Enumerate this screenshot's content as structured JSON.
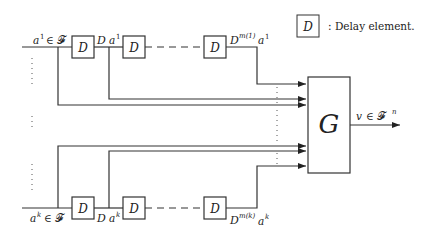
{
  "legend": {
    "box_label": "D",
    "text": ": Delay element."
  },
  "top_chain": {
    "input_label_var": "a",
    "input_label_sup": "1",
    "input_label_rest": "∈ 𝓕",
    "delay1_label": "D",
    "between_label_D": "D",
    "between_label_var": "a",
    "between_label_sup": "1",
    "delay2_label": "D",
    "delay3_label": "D",
    "output_label_D": "D",
    "output_label_sup": "m(1)",
    "output_label_var": "a",
    "output_label_var_sup": "1"
  },
  "bottom_chain": {
    "input_label_var": "a",
    "input_label_sup": "k",
    "input_label_rest": "∈ 𝓕",
    "delay1_label": "D",
    "between_label_D": "D",
    "between_label_var": "a",
    "between_label_sup": "k",
    "delay2_label": "D",
    "delay3_label": "D",
    "output_label_D": "D",
    "output_label_sup": "m(k)",
    "output_label_var": "a",
    "output_label_var_sup": "k"
  },
  "block": {
    "label": "G"
  },
  "output": {
    "label_var": "v",
    "label_rest": "∈ 𝓕",
    "label_sup": "n"
  },
  "colors": {
    "line": "#333333",
    "background": "#ffffff"
  }
}
